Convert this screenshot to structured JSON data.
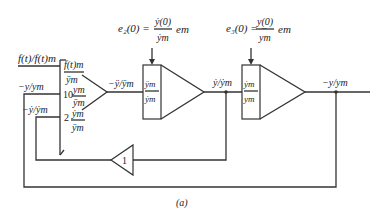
{
  "figure_label": "(a)",
  "annotations": {
    "e2": {
      "lhs": "e₂(0) =",
      "num": "ẏ(0)",
      "den": "ẏm",
      "rhs": "em"
    },
    "e3": {
      "lhs": "e₃(0) = −",
      "num": "y(0)",
      "den": "ym",
      "rhs": "em"
    }
  },
  "signals": {
    "input": "f(t)/f(t)m",
    "fb1": "−y/ym",
    "fb2": "−ẏ/ẏm",
    "out1": "−ÿ/ÿm",
    "out2": "ẏ/ẏm",
    "out3": "−y/ym"
  },
  "summer": {
    "in1_num": "f(t)m",
    "in1_den": "ÿm",
    "gain2": "10",
    "in2_num": "ym",
    "in2_den": "ÿm",
    "gain3": "2",
    "in3_num": "ẏm",
    "in3_den": "ÿm"
  },
  "integrator1": {
    "num": "ÿm",
    "den": "ẏm"
  },
  "integrator2": {
    "num": "ẏm",
    "den": "ym"
  },
  "inverter": {
    "gain": "1"
  }
}
